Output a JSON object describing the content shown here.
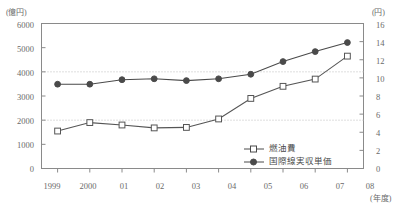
{
  "chart_data": {
    "type": "line",
    "title": "",
    "xlabel": "(年度)",
    "ylabel": "(億円)",
    "y2label": "(円)",
    "categories": [
      "1999",
      "2000",
      "01",
      "02",
      "03",
      "04",
      "05",
      "06",
      "07",
      "08"
    ],
    "ylim": [
      0,
      6000
    ],
    "yticks": [
      0,
      1000,
      2000,
      3000,
      4000,
      5000,
      6000
    ],
    "y2lim": [
      0,
      16
    ],
    "y2ticks": [
      0,
      2,
      4,
      6,
      8,
      10,
      12,
      14,
      16
    ],
    "grid": "horizontal-dotted-at-2000-and-4000",
    "legend_position": "inside-bottom-right",
    "series": [
      {
        "name": "燃油費",
        "axis": "left",
        "unit": "億円",
        "marker": "open-square",
        "color": "#555555",
        "values": [
          1550,
          1900,
          1800,
          1680,
          1700,
          2050,
          2900,
          3400,
          3700,
          4650
        ]
      },
      {
        "name": "国際線実収単価",
        "axis": "right",
        "unit": "円",
        "marker": "filled-circle",
        "color": "#4a4a4a",
        "values": [
          9.3,
          9.3,
          9.8,
          9.9,
          9.7,
          9.9,
          10.4,
          11.8,
          12.9,
          13.9
        ]
      }
    ]
  },
  "axes": {
    "left_unit": "(億円)",
    "right_unit": "(円)",
    "x_unit": "(年度)",
    "left_ticks": [
      "6000",
      "5000",
      "4000",
      "3000",
      "2000",
      "1000",
      "0"
    ],
    "right_ticks": [
      "16",
      "14",
      "12",
      "10",
      "8",
      "6",
      "4",
      "2",
      "0"
    ],
    "x_ticks": [
      "1999",
      "2000",
      "01",
      "02",
      "03",
      "04",
      "05",
      "06",
      "07",
      "08"
    ]
  },
  "legend": {
    "items": [
      {
        "label": "燃油費",
        "marker": "open-square"
      },
      {
        "label": "国際線実収単価",
        "marker": "filled-circle"
      }
    ]
  },
  "colors": {
    "line": "#4a4a4a",
    "frame": "#8a8a8a",
    "grid": "#bdbdbd",
    "text": "#5a5a5a",
    "background": "#ffffff"
  }
}
